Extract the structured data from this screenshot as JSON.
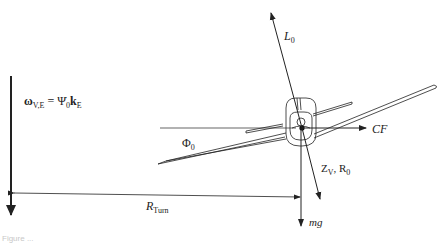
{
  "diagram": {
    "type": "free-body diagram",
    "labels": {
      "omega": {
        "main": "ω",
        "sub": "V,E",
        "eq": " = ",
        "psi": "Ψ̇",
        "psi_sub": "0",
        "k": "k",
        "k_sub": "E"
      },
      "lift": {
        "main": "L",
        "sub": "0"
      },
      "bank_angle": {
        "main": "Φ",
        "sub": "0"
      },
      "centrifugal": "CF",
      "z_force": {
        "main": "Z",
        "sub": "V",
        "sep": ", R",
        "sub2": "0"
      },
      "radius": {
        "main": "R",
        "sub": "Turn"
      },
      "weight": "mg"
    },
    "caption": "Figure ..."
  },
  "colors": {
    "line": "#222222",
    "background": "#ffffff"
  }
}
